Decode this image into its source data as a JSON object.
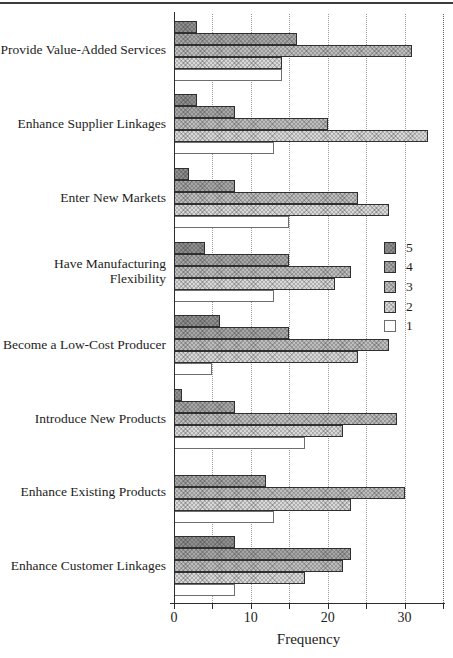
{
  "chart_data": {
    "type": "bar",
    "orientation": "horizontal",
    "title": "",
    "xlabel": "Frequency",
    "xlim": [
      0,
      35
    ],
    "xticks": [
      0,
      10,
      20,
      30
    ],
    "minor_tick_step": 5,
    "gridlines_at": [
      5,
      10,
      15,
      20,
      25,
      30,
      35
    ],
    "grid_style": "dotted-vertical",
    "categories": [
      "Provide Value-Added Services",
      "Enhance Supplier Linkages",
      "Enter New Markets",
      "Have Manufacturing Flexibility",
      "Become a Low-Cost Producer",
      "Introduce New Products",
      "Enhance Existing Products",
      "Enhance Customer Linkages"
    ],
    "legend": {
      "position": "right-middle",
      "entries": [
        "5",
        "4",
        "3",
        "2",
        "1"
      ]
    },
    "series": [
      {
        "name": "5",
        "color": "#8f8f8f",
        "values": [
          3,
          3,
          2,
          4,
          6,
          1,
          0,
          8
        ]
      },
      {
        "name": "4",
        "color": "#a6a6a6",
        "values": [
          16,
          8,
          8,
          15,
          15,
          8,
          12,
          23
        ]
      },
      {
        "name": "3",
        "color": "#bdbdbd",
        "values": [
          31,
          20,
          24,
          23,
          28,
          29,
          30,
          22
        ]
      },
      {
        "name": "2",
        "color": "#d8d8d8",
        "values": [
          14,
          33,
          28,
          21,
          24,
          22,
          23,
          17
        ]
      },
      {
        "name": "1",
        "color": "#ffffff",
        "values": [
          14,
          13,
          15,
          13,
          5,
          17,
          13,
          8
        ]
      }
    ]
  }
}
